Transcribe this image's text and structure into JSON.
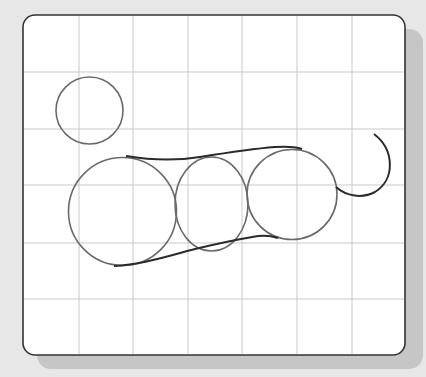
{
  "canvas": {
    "background": "#e7e7e7",
    "shadow_color": "#c6c6c6",
    "frame": {
      "x": 23,
      "y": 15,
      "width": 382,
      "height": 340,
      "radius": 12,
      "fill": "#ffffff",
      "stroke": "#333333"
    },
    "grid": {
      "color": "#c9c9c9",
      "vertical_x": [
        79,
        133,
        188,
        242,
        297,
        352
      ],
      "horizontal_y": [
        72,
        129,
        185,
        243,
        299
      ]
    }
  },
  "shapes": {
    "small_circle": {
      "cx": 89.5,
      "cy": 110.5,
      "r": 33.5,
      "stroke": "#6a6a6a"
    },
    "left_circle": {
      "cx": 122.5,
      "cy": 211.5,
      "r": 54,
      "stroke": "#6a6a6a"
    },
    "middle_ellipse": {
      "cx": 211.5,
      "cy": 204,
      "rx": 36.5,
      "ry": 47,
      "stroke": "#6a6a6a"
    },
    "right_circle": {
      "cx": 292,
      "cy": 194.5,
      "r": 45,
      "stroke": "#6a6a6a"
    },
    "top_outline": {
      "stroke": "#2a2a2a"
    },
    "bottom_outline": {
      "stroke": "#2a2a2a"
    },
    "tail": {
      "stroke": "#2a2a2a"
    }
  }
}
